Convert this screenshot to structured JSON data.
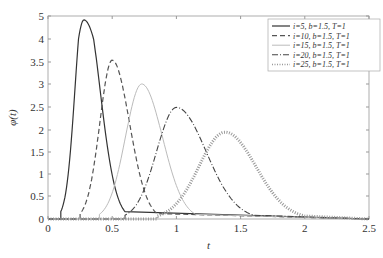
{
  "chart_data": {
    "type": "line",
    "title": "",
    "xlabel": "t",
    "ylabel": "φ(t)",
    "xlim": [
      0,
      2.5
    ],
    "x_ticks": [
      "0",
      "0.5",
      "1",
      "1.5",
      "2",
      "2.5"
    ],
    "y_ticks": [
      "0",
      "0.5",
      "1",
      "1.5",
      "2",
      "2.5",
      "3",
      "3.5",
      "4",
      "5"
    ],
    "grid": false,
    "legend_position": "upper right",
    "series": [
      {
        "name": "i=5, b=1.5, T=1",
        "style": "solid",
        "color": "#333333",
        "peak_t": 0.28,
        "peak_value": 4.83,
        "start_t": 0.1,
        "end_t": 0.6
      },
      {
        "name": "i=10, b=1.5, T=1",
        "style": "dashed",
        "color": "#555555",
        "peak_t": 0.5,
        "peak_value": 3.53,
        "start_t": 0.25,
        "end_t": 0.85
      },
      {
        "name": "i=15, b=1.5, T=1",
        "style": "solid-light",
        "color": "#bbbbbb",
        "peak_t": 0.73,
        "peak_value": 3.0,
        "start_t": 0.4,
        "end_t": 1.15
      },
      {
        "name": "i=20, b=1.5, T=1",
        "style": "dashdot",
        "color": "#444444",
        "peak_t": 1.0,
        "peak_value": 2.48,
        "start_t": 0.6,
        "end_t": 1.6
      },
      {
        "name": "i=25, b=1.5, T=1",
        "style": "dotted-marker",
        "color": "#999999",
        "peak_t": 1.38,
        "peak_value": 1.93,
        "start_t": 0.85,
        "end_t": 2.0
      }
    ]
  }
}
